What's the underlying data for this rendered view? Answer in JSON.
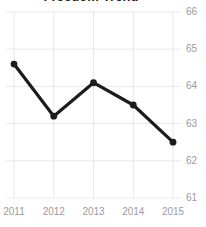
{
  "chart_data": {
    "type": "line",
    "title": "Freedom Trend",
    "xlabel": "",
    "ylabel": "",
    "categories": [
      "2011",
      "2012",
      "2013",
      "2014",
      "2015"
    ],
    "x": [
      2011,
      2012,
      2013,
      2014,
      2015
    ],
    "values": [
      64.6,
      63.2,
      64.1,
      63.5,
      62.5
    ],
    "series": [
      {
        "name": "Freedom Trend",
        "values": [
          64.6,
          63.2,
          64.1,
          63.5,
          62.5
        ]
      }
    ],
    "ylim": [
      61,
      66
    ],
    "yticks": [
      61,
      62,
      63,
      64,
      65,
      66
    ],
    "ytick_labels": [
      "61",
      "62",
      "63",
      "64",
      "65",
      "66"
    ],
    "xticks": [
      2011,
      2012,
      2013,
      2014,
      2015
    ],
    "xtick_labels": [
      "2011",
      "2012",
      "2013",
      "2014",
      "2015"
    ],
    "y_axis_position": "right",
    "grid": true,
    "grid_axis": "both",
    "legend": false,
    "legend_position": "none",
    "markers": true,
    "marker_shape": "circle",
    "colors": {
      "line": "#1c1c1c",
      "marker": "#1c1c1c",
      "grid": "#e8e8e8",
      "tick_label": "#9b9b9b",
      "title": "#1f1f1f",
      "background": "#ffffff"
    }
  }
}
